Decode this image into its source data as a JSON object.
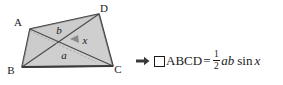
{
  "figure": {
    "name": "quadrilateral-abcd-with-diagonals",
    "vertices": [
      {
        "id": "A",
        "label": "A",
        "x": 30,
        "y": 29,
        "label_x": 18,
        "label_y": 26
      },
      {
        "id": "D",
        "label": "D",
        "x": 99,
        "y": 14,
        "label_x": 103,
        "label_y": 11
      },
      {
        "id": "C",
        "label": "C",
        "x": 113,
        "y": 66,
        "label_x": 116,
        "label_y": 72
      },
      {
        "id": "B",
        "label": "B",
        "x": 22,
        "y": 67,
        "label_x": 10,
        "label_y": 73
      }
    ],
    "diagonal_labels": [
      {
        "id": "b",
        "label": "b",
        "x": 59,
        "y": 33
      },
      {
        "id": "a",
        "label": "a",
        "x": 64,
        "y": 57
      }
    ],
    "angle_label": {
      "id": "x",
      "label": "x",
      "x": 75,
      "y": 42
    },
    "fill_color": "#d0d0d0",
    "stroke_color": "#3a3a3a",
    "angle_wedge_color": "#8a8a8a"
  },
  "formula": {
    "arrow": "➡",
    "arrow_icon_name": "right-arrow-icon",
    "quad_symbol_name": "quadrilateral-square-icon",
    "quad_label": "ABCD",
    "equals": "=",
    "fraction_numerator": "1",
    "fraction_denominator": "2",
    "variable_a": "a",
    "variable_b": "b",
    "function_sin": "sin",
    "variable_x": "x",
    "full_text": "➡ □ABCD = 1/2 ab sin x"
  },
  "colors": {
    "background": "#ffffff",
    "ink": "#1a1a1a",
    "shape_fill": "#d0d0d0",
    "shape_stroke": "#3a3a3a"
  }
}
